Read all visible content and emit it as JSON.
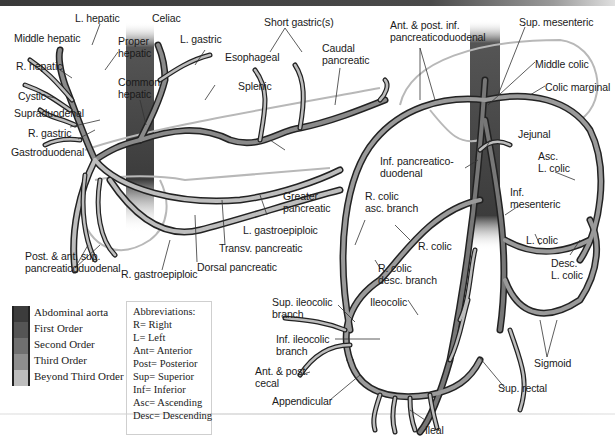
{
  "header": {
    "bar_color": "#3a3a3a"
  },
  "colors": {
    "abdominal_aorta": "#3c3c3c",
    "first_order": "#555555",
    "second_order": "#707070",
    "third_order": "#8e8e8e",
    "beyond_third_order": "#bdbdbd",
    "outline": "#222222",
    "organ_outline": "#b5b5b5"
  },
  "labels": {
    "celiac_side": {
      "l_hepatic": "L. hepatic",
      "celiac": "Celiac",
      "middle_hepatic": "Middle hepatic",
      "proper_hepatic": "Proper\nhepatic",
      "l_gastric": "L. gastric",
      "r_hepatic": "R. hepatic",
      "esophageal": "Esophageal",
      "cystic": "Cystic",
      "common_hepatic": "Common\nhepatic",
      "splenic": "Splenic",
      "supraduodenal": "Supraduodenal",
      "r_gastric": "R. gastric",
      "gastroduodenal": "Gastroduodenal",
      "short_gastrics": "Short gastric(s)",
      "caudal_pancreatic": "Caudal\npancreatic",
      "greater_pancreatic": "Greater\npancreatic",
      "l_gastroepiploic": "L. gastroepiploic",
      "transv_pancreatic": "Transv. pancreatic",
      "post_ant_sup_pd": "Post. & ant. sup.\npancreaticoduodenal",
      "r_gastroepiploic": "R. gastroepiploic",
      "dorsal_pancreatic": "Dorsal pancreatic"
    },
    "mesenteric_side": {
      "ant_post_inf_pd": "Ant. & post. inf.\npancreaticoduodenal",
      "sup_mesenteric": "Sup. mesenteric",
      "middle_colic": "Middle colic",
      "colic_marginal": "Colic marginal",
      "jejunal": "Jejunal",
      "inf_pancreaticoduodenal": "Inf. pancreatico-\nduodenal",
      "asc_l_colic": "Asc.\nL. colic",
      "r_colic_asc_branch": "R. colic\nasc. branch",
      "inf_mesenteric": "Inf.\nmesenteric",
      "r_colic": "R. colic",
      "l_colic": "L. colic",
      "r_colic_desc_branch": "R. colic\ndesc. branch",
      "desc_l_colic": "Desc.\nL. colic",
      "sup_ileocolic_branch": "Sup. ileocolic\nbranch",
      "ileocolic": "Ileocolic",
      "inf_ileocolic_branch": "Inf. ileocolic\nbranch",
      "sigmoid": "Sigmoid",
      "ant_post_cecal": "Ant. & post.\ncecal",
      "appendicular": "Appendicular",
      "sup_rectal": "Sup. rectal",
      "ileal": "Ileal"
    }
  },
  "legend": {
    "items": [
      {
        "label": "Abdominal aorta",
        "color": "#3c3c3c"
      },
      {
        "label": "First Order",
        "color": "#555555"
      },
      {
        "label": "Second Order",
        "color": "#707070"
      },
      {
        "label": "Third Order",
        "color": "#8e8e8e"
      },
      {
        "label": "Beyond Third Order",
        "color": "#bdbdbd"
      }
    ]
  },
  "abbreviations": {
    "title": "Abbreviations:",
    "items": [
      "R= Right",
      "L= Left",
      "Ant= Anterior",
      "Post= Posterior",
      "Sup= Superior",
      "Inf= Inferior",
      "Asc= Ascending",
      "Desc= Descending"
    ]
  }
}
